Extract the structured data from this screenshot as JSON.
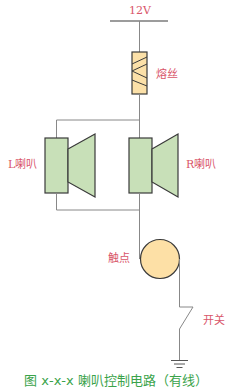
{
  "diagram": {
    "type": "circuit",
    "labels": {
      "voltage": "12V",
      "fuse": "熔丝",
      "left_speaker": "L喇叭",
      "right_speaker": "R喇叭",
      "contact": "触点",
      "switch": "开关"
    },
    "caption": "图 x-x-x 喇叭控制电路（有线）",
    "colors": {
      "label": "#d9566a",
      "caption": "#3aa34a",
      "wire": "#888888",
      "outline": "#3a3a3a",
      "speaker_fill": "#c8e0b8",
      "fuse_fill": "#fbe0a8",
      "contact_fill": "#fde0a6"
    },
    "components": [
      {
        "id": "supply",
        "kind": "power-rail",
        "label": "12V"
      },
      {
        "id": "fuse",
        "kind": "fuse",
        "label": "熔丝"
      },
      {
        "id": "left_speaker",
        "kind": "speaker",
        "label": "L喇叭"
      },
      {
        "id": "right_speaker",
        "kind": "speaker",
        "label": "R喇叭"
      },
      {
        "id": "contact",
        "kind": "contact",
        "label": "触点"
      },
      {
        "id": "switch",
        "kind": "switch",
        "label": "开关"
      },
      {
        "id": "ground",
        "kind": "ground"
      }
    ],
    "connections": [
      [
        "supply",
        "fuse"
      ],
      [
        "fuse",
        "left_speaker"
      ],
      [
        "fuse",
        "right_speaker"
      ],
      [
        "left_speaker",
        "contact"
      ],
      [
        "right_speaker",
        "contact"
      ],
      [
        "contact",
        "switch"
      ],
      [
        "switch",
        "ground"
      ]
    ]
  }
}
